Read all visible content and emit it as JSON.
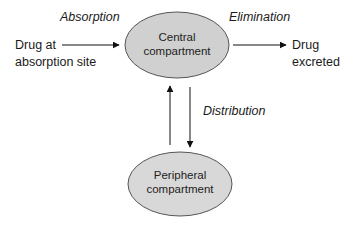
{
  "diagram": {
    "type": "pharmacokinetic two-compartment model",
    "nodes": {
      "central": {
        "line1": "Central",
        "line2": "compartment",
        "fill": "#d0d0d0",
        "stroke": "#555555"
      },
      "peripheral": {
        "line1": "Peripheral",
        "line2": "compartment",
        "fill": "#d8d8d8",
        "stroke": "#555555"
      },
      "source": {
        "line1": "Drug at",
        "line2": "absorption site"
      },
      "sink": {
        "line1": "Drug",
        "line2": "excreted"
      }
    },
    "edges": {
      "absorption": {
        "label": "Absorption",
        "from": "source",
        "to": "central"
      },
      "elimination": {
        "label": "Elimination",
        "from": "central",
        "to": "sink"
      },
      "distribution": {
        "label": "Distribution",
        "from": "central",
        "to": "peripheral",
        "bidirectional": true
      }
    }
  }
}
